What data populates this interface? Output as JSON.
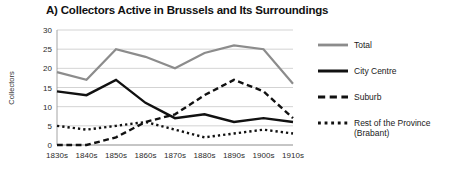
{
  "chart_data": {
    "type": "line",
    "title": "A) Collectors Active in Brussels and Its Surroundings",
    "xlabel": "",
    "ylabel": "Collectors",
    "categories": [
      "1830s",
      "1840s",
      "1850s",
      "1860s",
      "1870s",
      "1880s",
      "1890s",
      "1900s",
      "1910s"
    ],
    "ylim": [
      0,
      30
    ],
    "yticks": [
      0,
      5,
      10,
      15,
      20,
      25,
      30
    ],
    "ytick_labels": [
      "0",
      "5",
      "10",
      "15",
      "20",
      "25",
      "30"
    ],
    "grid": "horizontal",
    "legend_position": "right",
    "series": [
      {
        "name": "Total",
        "values": [
          19,
          17,
          25,
          23,
          20,
          24,
          26,
          25,
          16
        ],
        "color": "#8c8c8c",
        "style": "solid",
        "width": 2.2
      },
      {
        "name": "City Centre",
        "values": [
          14,
          13,
          17,
          11,
          7,
          8,
          6,
          7,
          6
        ],
        "color": "#111111",
        "style": "solid",
        "width": 2.4
      },
      {
        "name": "Suburb",
        "values": [
          0,
          0,
          2,
          6,
          8,
          13,
          17,
          14,
          7
        ],
        "color": "#111111",
        "style": "dashed",
        "width": 2.4
      },
      {
        "name": "Rest of the Province (Brabant)",
        "values": [
          5,
          4,
          5,
          6,
          4,
          2,
          3,
          4,
          3
        ],
        "color": "#111111",
        "style": "dotted",
        "width": 2.4
      }
    ]
  },
  "legend": {
    "items": [
      {
        "label": "Total"
      },
      {
        "label": "City Centre"
      },
      {
        "label": "Suburb"
      },
      {
        "label": "Rest of the Province",
        "label2": "(Brabant)"
      }
    ]
  }
}
